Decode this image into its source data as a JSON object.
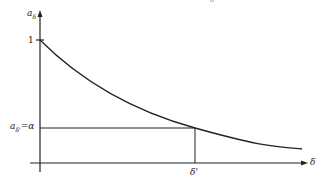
{
  "diagram": {
    "type": "decreasing curve with marked point",
    "top_fragment": "δ",
    "y_axis": {
      "label": "a",
      "label_sub": "δ",
      "tick_label": "1"
    },
    "x_axis": {
      "label": "δ"
    },
    "marked_point": {
      "y_label": "a",
      "y_label_sub": "δ'",
      "y_label_suffix": "=α",
      "x_label": "δ'"
    },
    "colors": {
      "ink": "#222222",
      "background": "#ffffff"
    }
  }
}
